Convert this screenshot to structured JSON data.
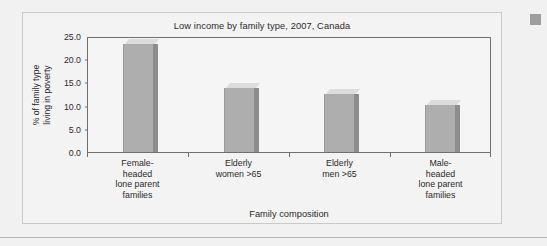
{
  "chart_data": {
    "type": "bar",
    "title": "Low income by family type, 2007, Canada",
    "xlabel": "Family composition",
    "ylabel_line1": "% of family type",
    "ylabel_line2": "living in poverty",
    "ylabel": "% of family type living in poverty",
    "categories": [
      "Female-\nheaded\nlone parent\nfamilies",
      "Elderly\nwomen >65",
      "Elderly\nmen >65",
      "Male-\nheaded\nlone parent\nfamilies"
    ],
    "category_lines": [
      [
        "Female-",
        "headed",
        "lone parent",
        "families"
      ],
      [
        "Elderly",
        "women >65"
      ],
      [
        "Elderly",
        "men >65"
      ],
      [
        "Male-",
        "headed",
        "lone parent",
        "families"
      ]
    ],
    "values": [
      23.2,
      13.9,
      12.5,
      10.2
    ],
    "ylim": [
      0.0,
      25.0
    ],
    "ytick_labels": [
      "0.0",
      "5.0",
      "10.0",
      "15.0",
      "20.0",
      "25.0"
    ],
    "ytick_values": [
      0,
      5,
      10,
      15,
      20,
      25
    ],
    "grid": false,
    "legend": "none",
    "style": "3d-column",
    "colors": {
      "bar_front": "#aeaeae",
      "bar_top": "#dcdcdc",
      "bar_side": "#8d8d8d",
      "plot_background": "#f5f5f5",
      "axis": "#707070",
      "text": "#2a2a2a",
      "panel_background": "#f3f3f3",
      "panel_border": "#c9c9c9",
      "page_background": "#f1f1f1",
      "scroll_marker": "#9e9e9e"
    }
  }
}
